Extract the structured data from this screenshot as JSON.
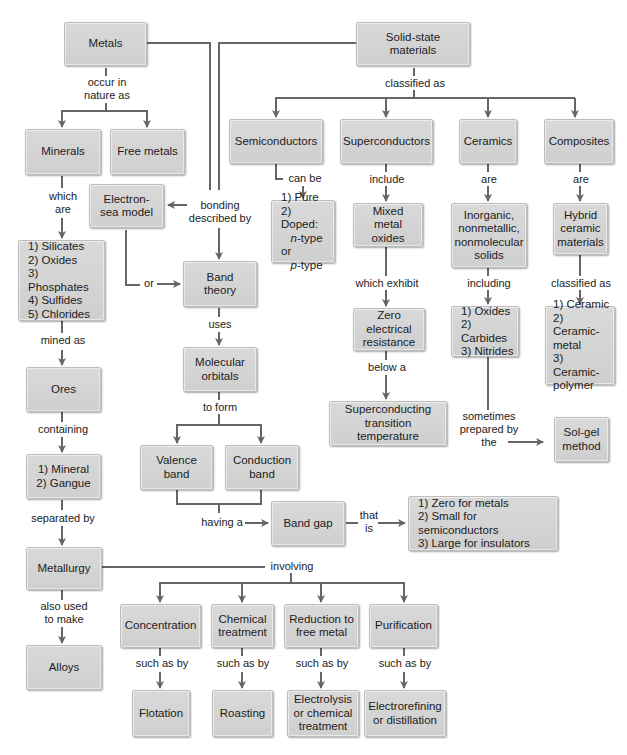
{
  "nodes": {
    "metals": "Metals",
    "solid_state": "Solid-state materials",
    "minerals": "Minerals",
    "free_metals": "Free metals",
    "electron_sea": "Electron-\nsea model",
    "mineral_list": "1) Silicates\n2) Oxides\n3) Phosphates\n4) Sulfides\n5) Chlorides",
    "band_theory": "Band\ntheory",
    "molecular_orbitals": "Molecular\norbitals",
    "ores": "Ores",
    "ore_contents": "1) Mineral\n2) Gangue",
    "valence_band": "Valence\nband",
    "conduction_band": "Conduction\nband",
    "band_gap": "Band gap",
    "band_gap_values": "1) Zero for metals\n2) Small for semiconductors\n3) Large for insulators",
    "metallurgy": "Metallurgy",
    "alloys": "Alloys",
    "semiconductors": "Semiconductors",
    "superconductors": "Superconductors",
    "ceramics": "Ceramics",
    "composites": "Composites",
    "semi_types": {
      "line1": "1) Pure",
      "line2": "2) Doped:",
      "n": "n",
      "line3_rest": "-type or",
      "p": "p",
      "line4_rest": "-type"
    },
    "mixed_metal_oxides": "Mixed metal\noxides",
    "zero_resistance": "Zero electrical\nresistance",
    "sc_transition": "Superconducting\ntransition temperature",
    "inorganic_solids": "Inorganic,\nnonmetallic,\nnonmolecular\nsolids",
    "ceramic_list": "1) Oxides\n2) Carbides\n3) Nitrides",
    "sol_gel": "Sol-gel\nmethod",
    "hybrid_ceramic": "Hybrid\nceramic\nmaterials",
    "composite_list": "1) Ceramic\n2) Ceramic-\n    metal\n3) Ceramic-\n    polymer",
    "concentration": "Concentration",
    "chemical_treatment": "Chemical\ntreatment",
    "reduction": "Reduction to\nfree metal",
    "purification": "Purification",
    "flotation": "Flotation",
    "roasting": "Roasting",
    "electrolysis": "Electrolysis\nor chemical\ntreatment",
    "electrorefining": "Electrorefining\nor distillation"
  },
  "labels": {
    "occur_in_nature": "occur in\nnature as",
    "classified_as": "classified as",
    "which_are": "which\nare",
    "bonding_described": "bonding\ndescribed by",
    "can_be": "can be",
    "include": "include",
    "ceramics_are": "are",
    "composites_are": "are",
    "or": "or",
    "uses": "uses",
    "mined_as": "mined as",
    "which_exhibit": "which exhibit",
    "including": "including",
    "composites_classified_as": "classified as",
    "below_a": "below a",
    "containing": "containing",
    "to_form": "to form",
    "sometimes_prepared": "sometimes\nprepared by\nthe",
    "separated_by": "separated by",
    "having_a": "having a",
    "that_is": "that\nis",
    "involving": "involving",
    "also_used": "also used\nto make",
    "such_as_1": "such as by",
    "such_as_2": "such as by",
    "such_as_3": "such as by",
    "such_as_4": "such as by"
  },
  "colors": {
    "node_fill": "#d4d4d4",
    "line": "#666666",
    "text": "#1c1c1c",
    "background": "#ffffff"
  }
}
